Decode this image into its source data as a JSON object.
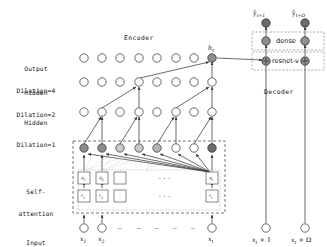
{
  "figure": {
    "title_encoder": "Encoder",
    "title_decoder": "Decoder"
  },
  "row_labels": [
    {
      "id": "output-dilation-4",
      "line1": "Output",
      "line2": "Dilation=4"
    },
    {
      "id": "hidden-dilation-2",
      "line1": "Hidden",
      "line2": "Dilation=2"
    },
    {
      "id": "hidden-dilation-1",
      "line1": "Hidden",
      "line2": "Dilation=1"
    },
    {
      "id": "self-attention",
      "line1": "Self-",
      "line2": "attention"
    },
    {
      "id": "input",
      "line1": "Input",
      "line2": ""
    }
  ],
  "encoder": {
    "node_count": 8,
    "hidden_node_fill": "#ffffff",
    "hidden_node_stroke": "#444444",
    "h_label": "h",
    "h_label_sub": "t",
    "attention_fills": [
      "#8c8c8c",
      "#8c8c8c",
      "#c9c9c9",
      "#c9c9c9",
      "#b3b3b3",
      "#ffffff",
      "#ffffff",
      "#6b6b6b"
    ],
    "output_highlight_fill": "#8f8f8f"
  },
  "attention_boxes": {
    "top_row": [
      "q",
      "q",
      "",
      "",
      "q"
    ],
    "top_row_subs": [
      "1",
      "2",
      "",
      "",
      "t"
    ],
    "bottom_row": [
      "r",
      "r",
      "",
      "",
      "r"
    ],
    "bottom_row_subs": [
      "1",
      "2",
      "",
      "",
      "t"
    ],
    "ellipsis": "..."
  },
  "input_labels": [
    {
      "base": "x",
      "sub": "1"
    },
    {
      "base": "x",
      "sub": "2"
    },
    {
      "base": "x",
      "sub": "t"
    }
  ],
  "input_dashes": [
    "—",
    "—",
    "—",
    "—",
    "—"
  ],
  "decoder": {
    "blocks": [
      {
        "id": "dense-block",
        "label": "dense"
      },
      {
        "id": "resnet-v-block",
        "label": "resnet-v"
      }
    ],
    "outputs": [
      {
        "base": "ŷ",
        "sub": "t+1"
      },
      {
        "base": "ŷ",
        "sub": "t+Ω"
      }
    ],
    "inputs": [
      {
        "base": "x",
        "sub": "t",
        "suffix": " + 1"
      },
      {
        "base": "x",
        "sub": "t",
        "suffix": " + Ω"
      }
    ],
    "node_fill": "#8f8f8f",
    "node_stroke": "#333333"
  },
  "colors": {
    "line": "#3a3a3a",
    "dashed_border": "#555555",
    "text": "#111111",
    "node_stroke": "#444444"
  }
}
